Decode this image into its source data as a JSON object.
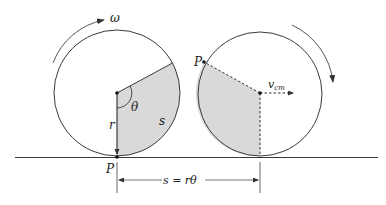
{
  "diagram": {
    "labels": {
      "omega": "ω",
      "theta": "θ",
      "r": "r",
      "s": "s",
      "P_left": "P",
      "P_right": "P",
      "v": "v",
      "v_sub": "cm",
      "distance": "s = rθ"
    },
    "colors": {
      "line": "#3a3a3a",
      "shade": "#d9d9d9",
      "background": "#ffffff"
    }
  }
}
